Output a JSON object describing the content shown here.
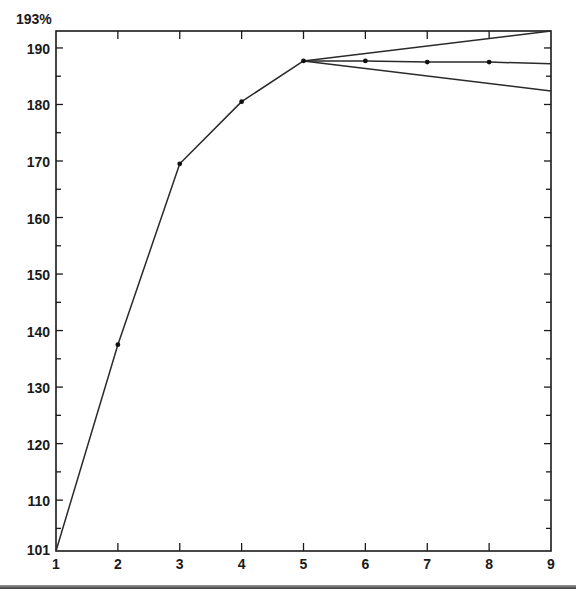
{
  "chart_data": {
    "type": "line",
    "title": "",
    "xlabel": "",
    "ylabel": "",
    "y_top_label": "193%",
    "xlim": [
      1,
      9
    ],
    "ylim": [
      101,
      193
    ],
    "grid": false,
    "x_ticks": [
      "1",
      "2",
      "3",
      "4",
      "5",
      "6",
      "7",
      "8",
      "9"
    ],
    "y_ticks": [
      "101",
      "110",
      "120",
      "130",
      "140",
      "150",
      "160",
      "170",
      "180",
      "190"
    ],
    "series": [
      {
        "name": "main",
        "x": [
          1,
          2,
          3,
          4,
          5,
          6,
          7,
          8,
          9
        ],
        "values": [
          101,
          137.5,
          169.5,
          180.5,
          187.7,
          187.7,
          187.5,
          187.5,
          187.2
        ],
        "markers": [
          false,
          true,
          true,
          true,
          true,
          true,
          true,
          true,
          false
        ]
      },
      {
        "name": "upper-projection",
        "x": [
          5,
          9
        ],
        "values": [
          187.7,
          193
        ]
      },
      {
        "name": "lower-projection",
        "x": [
          5,
          9
        ],
        "values": [
          187.7,
          182.4
        ]
      }
    ]
  },
  "colors": {
    "line": "#2a2a2a",
    "axis": "#1a1a1a",
    "background": "#ffffff"
  }
}
